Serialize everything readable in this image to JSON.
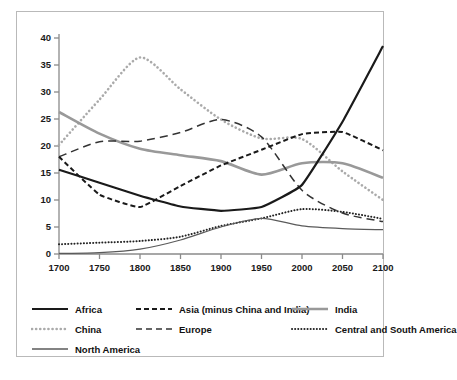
{
  "chart_data": {
    "type": "line",
    "title": "",
    "xlabel": "",
    "ylabel": "",
    "xlim": [
      1700,
      2100
    ],
    "ylim": [
      0,
      40
    ],
    "xticks": [
      1700,
      1750,
      1800,
      1850,
      1900,
      1950,
      2000,
      2050,
      2100
    ],
    "yticks": [
      0,
      5,
      10,
      15,
      20,
      25,
      30,
      35,
      40
    ],
    "grid": false,
    "legend_position": "bottom",
    "x": [
      1700,
      1750,
      1800,
      1850,
      1900,
      1950,
      2000,
      2050,
      2100
    ],
    "series": [
      {
        "name": "Africa",
        "style": "solid",
        "color": "#1a1a1a",
        "width": 2.2,
        "values": [
          15.6,
          13.2,
          10.8,
          8.8,
          8.0,
          8.7,
          12.8,
          24.5,
          38.5
        ]
      },
      {
        "name": "Asia (minus China and India)",
        "style": "dashed",
        "color": "#1a1a1a",
        "width": 2.0,
        "values": [
          18.0,
          11.0,
          8.7,
          12.6,
          16.4,
          19.3,
          22.2,
          22.6,
          19.2
        ]
      },
      {
        "name": "India",
        "style": "solid",
        "color": "#999999",
        "width": 2.6,
        "values": [
          26.3,
          22.3,
          19.5,
          18.3,
          17.2,
          14.7,
          16.8,
          16.8,
          14.1
        ]
      },
      {
        "name": "China",
        "style": "dotted",
        "color": "#aaaaaa",
        "width": 2.6,
        "values": [
          20.2,
          28.6,
          36.4,
          30.5,
          24.9,
          21.4,
          21.3,
          15.3,
          10.0
        ]
      },
      {
        "name": "Europe",
        "style": "longdash",
        "color": "#333333",
        "width": 1.5,
        "values": [
          18.0,
          20.8,
          20.9,
          22.5,
          24.9,
          21.7,
          11.8,
          7.6,
          6.0
        ]
      },
      {
        "name": "Central and South America",
        "style": "fine-dotted",
        "color": "#222222",
        "width": 2.0,
        "values": [
          1.8,
          2.1,
          2.4,
          3.2,
          5.2,
          6.6,
          8.3,
          7.8,
          6.5
        ]
      },
      {
        "name": "North America",
        "style": "solid-thin",
        "color": "#5a5a5a",
        "width": 1.2,
        "values": [
          0.1,
          0.25,
          0.9,
          2.6,
          5.0,
          6.6,
          5.2,
          4.7,
          4.5
        ]
      }
    ]
  },
  "axes": {
    "y_tick_labels": [
      "40",
      "35",
      "30",
      "25",
      "20",
      "15",
      "10",
      "5",
      "0"
    ],
    "x_tick_labels": [
      "1700",
      "1750",
      "1800",
      "1850",
      "1900",
      "1950",
      "2000",
      "2050",
      "2100"
    ]
  },
  "legend": {
    "rows": [
      [
        {
          "label": "Africa",
          "style": "solid"
        },
        {
          "label": "Asia (minus China and India)",
          "style": "dashed"
        },
        {
          "label": "India",
          "style": "india"
        }
      ],
      [
        {
          "label": "China",
          "style": "dotted"
        },
        {
          "label": "Europe",
          "style": "longdash"
        },
        {
          "label": "Central and South America",
          "style": "fine-dotted"
        }
      ],
      [
        {
          "label": "North America",
          "style": "solid-thin"
        }
      ]
    ]
  }
}
